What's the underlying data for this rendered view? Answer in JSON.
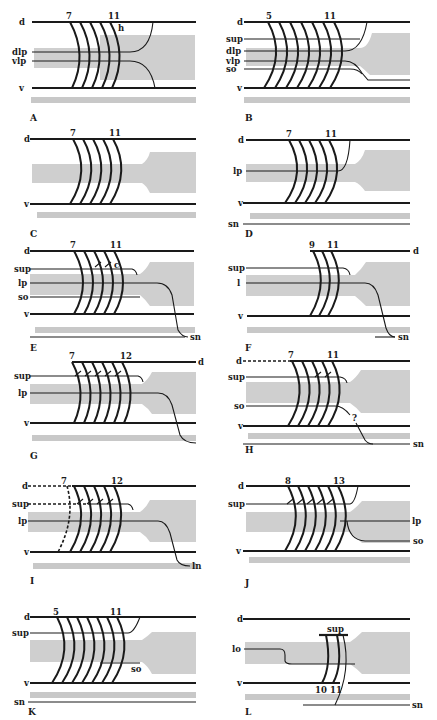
{
  "figure": {
    "caption": "Fig. 4. The formative stages of Ciona... (caption partially cut off)",
    "colors": {
      "line": "#1a1a1a",
      "shade": "#cfcfcf",
      "strip": "#c8c8c8",
      "background": "#ffffff"
    }
  },
  "panels": [
    {
      "id": "A",
      "label": "A",
      "numbers": [
        "7",
        "11",
        "h"
      ],
      "lines": [
        "d",
        "dlp",
        "vlp",
        "v"
      ]
    },
    {
      "id": "B",
      "label": "B",
      "numbers": [
        "5",
        "11"
      ],
      "lines": [
        "d",
        "sup",
        "dlp",
        "vlp",
        "so",
        "v"
      ]
    },
    {
      "id": "C",
      "label": "C",
      "numbers": [
        "7",
        "11"
      ],
      "lines": [
        "d",
        "v"
      ]
    },
    {
      "id": "D",
      "label": "D",
      "numbers": [
        "7",
        "11"
      ],
      "lines": [
        "d",
        "lp",
        "v",
        "sn"
      ]
    },
    {
      "id": "E",
      "label": "E",
      "numbers": [
        "7",
        "11",
        "c"
      ],
      "lines": [
        "d",
        "sup",
        "lp",
        "so",
        "v",
        "sn"
      ]
    },
    {
      "id": "F",
      "label": "F",
      "numbers": [
        "9",
        "11"
      ],
      "lines": [
        "d",
        "sup",
        "l",
        "v",
        "sn"
      ]
    },
    {
      "id": "G",
      "label": "G",
      "numbers": [
        "7",
        "12"
      ],
      "lines": [
        "d",
        "sup",
        "lp",
        "v"
      ]
    },
    {
      "id": "H",
      "label": "H",
      "numbers": [
        "7",
        "11",
        "?"
      ],
      "lines": [
        "d",
        "sup",
        "so",
        "v",
        "sn"
      ]
    },
    {
      "id": "I",
      "label": "I",
      "numbers": [
        "7",
        "12"
      ],
      "lines": [
        "d",
        "sup",
        "lp",
        "v",
        "ln"
      ]
    },
    {
      "id": "J",
      "label": "J",
      "numbers": [
        "8",
        "13"
      ],
      "lines": [
        "d",
        "sup",
        "lp",
        "so",
        "v"
      ]
    },
    {
      "id": "K",
      "label": "K",
      "numbers": [
        "5",
        "11"
      ],
      "lines": [
        "d",
        "sup",
        "so",
        "v",
        "sn"
      ]
    },
    {
      "id": "L",
      "label": "L",
      "numbers": [
        "10",
        "11"
      ],
      "lines": [
        "d",
        "sup",
        "lo",
        "v",
        "sn"
      ]
    }
  ]
}
